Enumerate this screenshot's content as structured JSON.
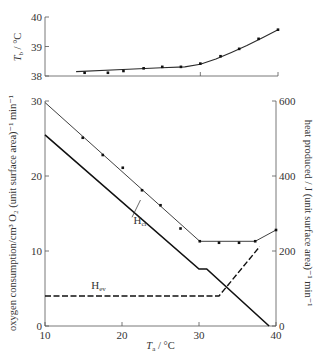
{
  "chart_data": [
    {
      "id": "top",
      "type": "line",
      "title": "",
      "xlabel": "",
      "ylabel": "T_b / °C",
      "ylabel_main": "T",
      "ylabel_sub": "b",
      "ylabel_rest": " / °C",
      "xlim": [
        10,
        40
      ],
      "ylim": [
        38,
        40
      ],
      "yticks": [
        38,
        39,
        40
      ],
      "xticks": [
        30,
        40
      ],
      "grid": false,
      "series": [
        {
          "name": "Body temperature",
          "style": "solid-with-markers",
          "x": [
            15.1,
            18.1,
            20.1,
            22.7,
            25.1,
            27.5,
            30.0,
            32.6,
            35.0,
            37.5,
            40.0
          ],
          "values": [
            38.11,
            38.11,
            38.17,
            38.26,
            38.31,
            38.31,
            38.42,
            38.67,
            38.92,
            39.26,
            39.57
          ]
        },
        {
          "name": "Fitted curve",
          "style": "solid",
          "x": [
            14,
            20,
            25,
            28,
            30,
            32,
            34,
            36,
            38,
            40
          ],
          "values": [
            38.15,
            38.22,
            38.28,
            38.31,
            38.4,
            38.58,
            38.8,
            39.03,
            39.3,
            39.57
          ]
        }
      ]
    },
    {
      "id": "bottom",
      "type": "line",
      "title": "",
      "xlabel": "T_a / °C",
      "xlabel_main": "T",
      "xlabel_sub": "a",
      "xlabel_rest": " / °C",
      "ylabel": "oxygen consumption/cm³ O₂ (unit surface area)⁻¹ min⁻¹",
      "ylabel_right": "heat produced / J (unit surface area)⁻¹ min⁻¹",
      "xlim": [
        10,
        40
      ],
      "ylim": [
        0,
        30
      ],
      "ylim_right": [
        0,
        600
      ],
      "xticks": [
        10,
        20,
        30,
        40
      ],
      "yticks": [
        0,
        10,
        20,
        30
      ],
      "yticks_right": [
        0,
        200,
        400,
        600
      ],
      "grid": false,
      "annotations": [
        {
          "text": "H",
          "sub": "cr",
          "x": 21.5,
          "y": 13.6
        },
        {
          "text": "H",
          "sub": "ev",
          "x": 16.0,
          "y": 4.9
        }
      ],
      "series": [
        {
          "name": "Oxygen consumption (measured)",
          "style": "markers",
          "x": [
            14.9,
            17.5,
            20.1,
            22.6,
            25.0,
            27.6,
            30.1,
            32.6,
            35.2,
            37.3,
            40.0
          ],
          "values": [
            25.1,
            22.8,
            21.1,
            18.1,
            16.1,
            13.0,
            11.3,
            11.1,
            11.1,
            11.3,
            12.8
          ]
        },
        {
          "name": "Total heat production (fit)",
          "style": "thin-solid",
          "x": [
            10,
            30.1,
            37.3,
            40.0
          ],
          "values": [
            29.8,
            11.3,
            11.3,
            12.8
          ]
        },
        {
          "name": "H_cr (conductive/radiative heat loss)",
          "style": "thick-solid",
          "x": [
            10,
            30.0,
            31.0,
            39.1
          ],
          "values": [
            25.5,
            7.6,
            7.6,
            0
          ]
        },
        {
          "name": "H_ev (evaporative heat loss)",
          "style": "dashed",
          "x": [
            10,
            32.6,
            37.9
          ],
          "values": [
            4.0,
            4.0,
            10.6
          ]
        }
      ]
    }
  ],
  "labels": {
    "top_ytick_38": "38",
    "top_ytick_39": "39",
    "top_ytick_40": "40",
    "bottom_xticks": [
      "10",
      "20",
      "30",
      "40"
    ],
    "bottom_yticks_left": [
      "0",
      "10",
      "20",
      "30"
    ],
    "bottom_yticks_right": [
      "0",
      "200",
      "400",
      "600"
    ]
  }
}
